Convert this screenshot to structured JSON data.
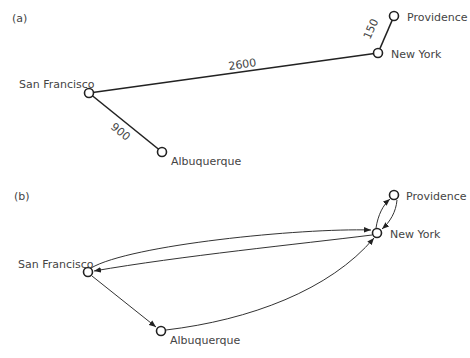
{
  "panels": [
    {
      "label": "(a)",
      "type": "undirected weighted graph",
      "nodes": [
        {
          "id": "sf",
          "name": "San Francisco"
        },
        {
          "id": "ny",
          "name": "New York"
        },
        {
          "id": "pr",
          "name": "Providence"
        },
        {
          "id": "al",
          "name": "Albuquerque"
        }
      ],
      "edges": [
        {
          "from": "sf",
          "to": "ny",
          "weight": "2600"
        },
        {
          "from": "ny",
          "to": "pr",
          "weight": "150"
        },
        {
          "from": "sf",
          "to": "al",
          "weight": "900"
        }
      ]
    },
    {
      "label": "(b)",
      "type": "directed graph",
      "nodes": [
        {
          "id": "sf",
          "name": "San Francisco"
        },
        {
          "id": "ny",
          "name": "New York"
        },
        {
          "id": "pr",
          "name": "Providence"
        },
        {
          "id": "al",
          "name": "Albuquerque"
        }
      ],
      "edges": [
        {
          "from": "sf",
          "to": "ny"
        },
        {
          "from": "ny",
          "to": "sf"
        },
        {
          "from": "ny",
          "to": "pr"
        },
        {
          "from": "pr",
          "to": "ny"
        },
        {
          "from": "sf",
          "to": "al"
        },
        {
          "from": "al",
          "to": "ny"
        }
      ]
    }
  ]
}
